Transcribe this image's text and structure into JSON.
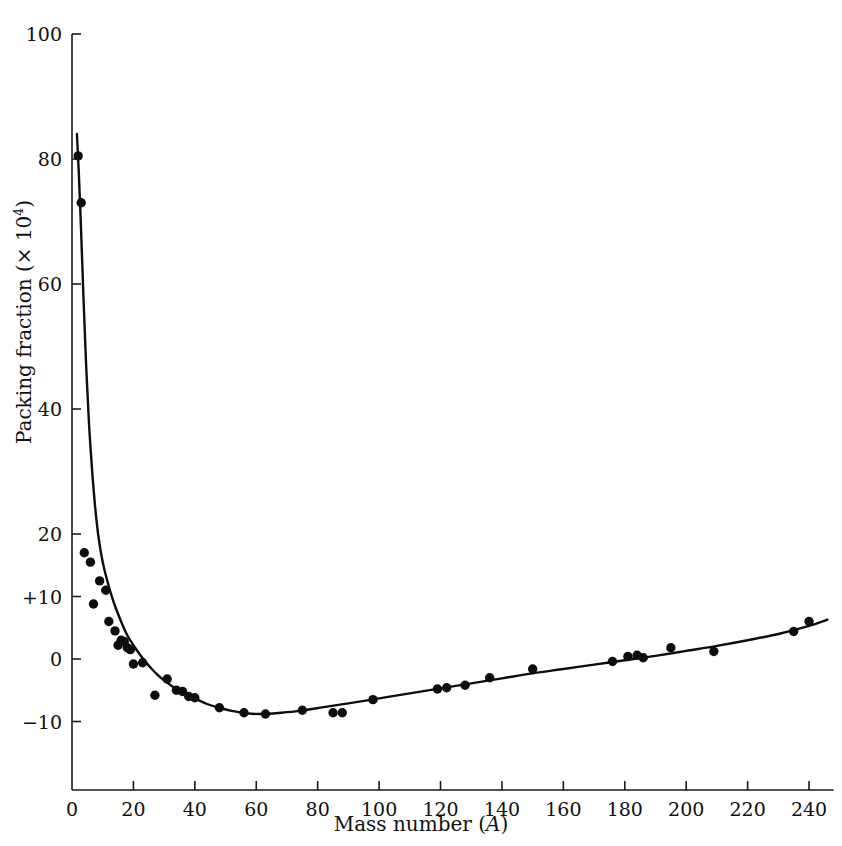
{
  "chart_data": {
    "type": "scatter",
    "title": "",
    "xlabel": "Mass number (A)",
    "ylabel": "Packing fraction (× 10⁴)",
    "ylabel_prefix": "Packing fraction (× 10",
    "ylabel_exponent": "4",
    "ylabel_suffix": ")",
    "xlabel_prefix": "Mass number (",
    "xlabel_italic": "A",
    "xlabel_suffix": ")",
    "xlim": [
      0,
      248
    ],
    "ylim": [
      -14,
      100
    ],
    "grid": false,
    "legend": null,
    "xticks": [
      0,
      20,
      40,
      60,
      80,
      100,
      120,
      140,
      160,
      180,
      200,
      220,
      240
    ],
    "xtick_labels": [
      "0",
      "20",
      "40",
      "60",
      "80",
      "100",
      "120",
      "140",
      "160",
      "180",
      "200",
      "220",
      "240"
    ],
    "yticks": [
      100,
      80,
      60,
      40,
      20,
      10,
      0,
      -10
    ],
    "ytick_labels": [
      "100",
      "80",
      "60",
      "40",
      "20",
      "+10",
      "0",
      "−10"
    ],
    "series": [
      {
        "name": "measured packing fraction",
        "marker": "filled-circle",
        "marker_color": "#0d0d0d",
        "marker_size": 7,
        "points": [
          [
            2,
            80.5
          ],
          [
            3,
            73.0
          ],
          [
            4,
            17.0
          ],
          [
            6,
            15.5
          ],
          [
            7,
            8.8
          ],
          [
            9,
            12.5
          ],
          [
            11,
            11.0
          ],
          [
            12,
            6.0
          ],
          [
            14,
            4.5
          ],
          [
            15,
            2.2
          ],
          [
            16,
            3.0
          ],
          [
            17,
            2.8
          ],
          [
            18,
            1.8
          ],
          [
            19,
            1.5
          ],
          [
            20,
            -0.8
          ],
          [
            23,
            -0.6
          ],
          [
            27,
            -5.8
          ],
          [
            31,
            -3.2
          ],
          [
            34,
            -5.0
          ],
          [
            36,
            -5.2
          ],
          [
            38,
            -6.0
          ],
          [
            40,
            -6.2
          ],
          [
            48,
            -7.8
          ],
          [
            56,
            -8.6
          ],
          [
            63,
            -8.8
          ],
          [
            75,
            -8.2
          ],
          [
            85,
            -8.6
          ],
          [
            88,
            -8.6
          ],
          [
            98,
            -6.5
          ],
          [
            119,
            -4.8
          ],
          [
            122,
            -4.6
          ],
          [
            128,
            -4.2
          ],
          [
            136,
            -3.0
          ],
          [
            150,
            -1.6
          ],
          [
            176,
            -0.4
          ],
          [
            181,
            0.4
          ],
          [
            184,
            0.6
          ],
          [
            186,
            0.2
          ],
          [
            195,
            1.8
          ],
          [
            209,
            1.2
          ],
          [
            235,
            4.4
          ],
          [
            240,
            6.0
          ]
        ]
      },
      {
        "name": "fitted packing fraction curve",
        "type": "line",
        "line_color": "#0d0d0d",
        "line_width": 2.4,
        "points": [
          [
            1.6,
            84.0
          ],
          [
            2.2,
            78.0
          ],
          [
            3.0,
            68.0
          ],
          [
            3.8,
            57.0
          ],
          [
            4.6,
            47.0
          ],
          [
            5.5,
            38.0
          ],
          [
            6.5,
            30.5
          ],
          [
            7.5,
            24.5
          ],
          [
            8.5,
            20.0
          ],
          [
            9.5,
            16.8
          ],
          [
            10.5,
            14.4
          ],
          [
            12.0,
            11.6
          ],
          [
            13.5,
            9.2
          ],
          [
            15.0,
            7.2
          ],
          [
            16.5,
            5.4
          ],
          [
            18.0,
            3.8
          ],
          [
            20.0,
            2.2
          ],
          [
            22.0,
            0.8
          ],
          [
            24.0,
            -0.5
          ],
          [
            26.0,
            -1.6
          ],
          [
            28.0,
            -2.6
          ],
          [
            30.0,
            -3.4
          ],
          [
            33.0,
            -4.5
          ],
          [
            36.0,
            -5.4
          ],
          [
            40.0,
            -6.3
          ],
          [
            44.0,
            -7.2
          ],
          [
            48.0,
            -7.8
          ],
          [
            52.0,
            -8.3
          ],
          [
            57.0,
            -8.7
          ],
          [
            62.0,
            -8.8
          ],
          [
            68.0,
            -8.6
          ],
          [
            74.0,
            -8.3
          ],
          [
            82.0,
            -7.7
          ],
          [
            90.0,
            -7.1
          ],
          [
            100.0,
            -6.3
          ],
          [
            110.0,
            -5.5
          ],
          [
            120.0,
            -4.7
          ],
          [
            130.0,
            -3.9
          ],
          [
            140.0,
            -3.1
          ],
          [
            150.0,
            -2.3
          ],
          [
            160.0,
            -1.6
          ],
          [
            170.0,
            -0.9
          ],
          [
            180.0,
            -0.2
          ],
          [
            190.0,
            0.5
          ],
          [
            200.0,
            1.3
          ],
          [
            210.0,
            2.1
          ],
          [
            220.0,
            3.0
          ],
          [
            230.0,
            4.0
          ],
          [
            240.0,
            5.3
          ],
          [
            246.0,
            6.3
          ]
        ]
      }
    ]
  },
  "axes": {
    "axis_color": "#1a1a1a",
    "axis_line_width": 1.6,
    "tick_length": 9
  }
}
